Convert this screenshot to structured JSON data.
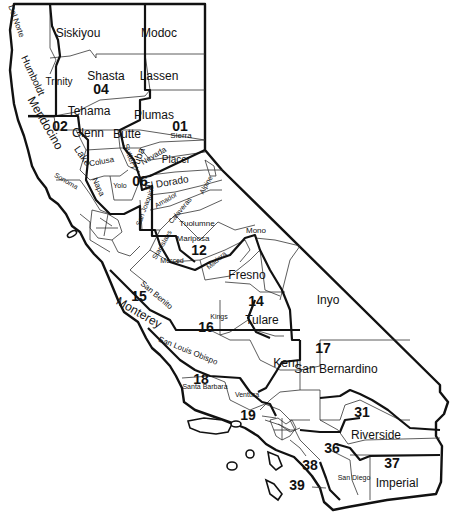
{
  "map": {
    "title": "California Counties and Districts",
    "colors": {
      "ink": "#111111",
      "paper": "#ffffff"
    },
    "counties": [
      {
        "name": "Del Norte",
        "x": 14,
        "y": 22,
        "rot": 70,
        "size": "sm"
      },
      {
        "name": "Siskiyou",
        "x": 78,
        "y": 37,
        "rot": 0,
        "size": "lg"
      },
      {
        "name": "Modoc",
        "x": 159,
        "y": 37,
        "rot": 0,
        "size": "lg"
      },
      {
        "name": "Humboldt",
        "x": 30,
        "y": 77,
        "rot": 65,
        "size": "md"
      },
      {
        "name": "Trinity",
        "x": 59,
        "y": 85,
        "rot": 0,
        "size": "md"
      },
      {
        "name": "Shasta",
        "x": 106,
        "y": 80,
        "rot": 0,
        "size": "lg"
      },
      {
        "name": "Lassen",
        "x": 159,
        "y": 80,
        "rot": 0,
        "size": "lg"
      },
      {
        "name": "Tehama",
        "x": 89,
        "y": 115,
        "rot": 0,
        "size": "lg"
      },
      {
        "name": "Plumas",
        "x": 154,
        "y": 119,
        "rot": 0,
        "size": "lg"
      },
      {
        "name": "Mendocino",
        "x": 42,
        "y": 125,
        "rot": 60,
        "size": "lg"
      },
      {
        "name": "Glenn",
        "x": 88,
        "y": 137,
        "rot": 0,
        "size": "lg"
      },
      {
        "name": "Butte",
        "x": 127,
        "y": 138,
        "rot": 0,
        "size": "lg"
      },
      {
        "name": "Sierra",
        "x": 181,
        "y": 138,
        "rot": 0,
        "size": "sm"
      },
      {
        "name": "Lake",
        "x": 80,
        "y": 158,
        "rot": 55,
        "size": "md"
      },
      {
        "name": "Colusa",
        "x": 102,
        "y": 164,
        "rot": -10,
        "size": "sm"
      },
      {
        "name": "Sutter",
        "x": 127,
        "y": 155,
        "rot": 70,
        "size": "sm"
      },
      {
        "name": "Yuba",
        "x": 141,
        "y": 160,
        "rot": -70,
        "size": "md"
      },
      {
        "name": "Nevada",
        "x": 155,
        "y": 158,
        "rot": -30,
        "size": "sm"
      },
      {
        "name": "Placer",
        "x": 176,
        "y": 163,
        "rot": 0,
        "size": "md"
      },
      {
        "name": "Sonoma",
        "x": 65,
        "y": 183,
        "rot": 30,
        "size": "xs"
      },
      {
        "name": "Napa",
        "x": 96,
        "y": 188,
        "rot": 65,
        "size": "sm"
      },
      {
        "name": "Yolo",
        "x": 120,
        "y": 188,
        "rot": 0,
        "size": "xs"
      },
      {
        "name": "El Dorado",
        "x": 167,
        "y": 186,
        "rot": -10,
        "size": "md"
      },
      {
        "name": "Amador",
        "x": 167,
        "y": 202,
        "rot": -30,
        "size": "xs"
      },
      {
        "name": "Alpine",
        "x": 208,
        "y": 186,
        "rot": -60,
        "size": "xs"
      },
      {
        "name": "San Joaquin",
        "x": 147,
        "y": 208,
        "rot": -70,
        "size": "xs"
      },
      {
        "name": "Calaveras",
        "x": 182,
        "y": 212,
        "rot": -50,
        "size": "xs"
      },
      {
        "name": "Tuolumne",
        "x": 197,
        "y": 226,
        "rot": 0,
        "size": "sm"
      },
      {
        "name": "Mono",
        "x": 256,
        "y": 233,
        "rot": 0,
        "size": "sm"
      },
      {
        "name": "Stanislaus",
        "x": 164,
        "y": 246,
        "rot": -60,
        "size": "xs"
      },
      {
        "name": "Mariposa",
        "x": 193,
        "y": 241,
        "rot": 0,
        "size": "sm"
      },
      {
        "name": "Merced",
        "x": 172,
        "y": 263,
        "rot": 0,
        "size": "xs"
      },
      {
        "name": "Madera",
        "x": 218,
        "y": 262,
        "rot": -40,
        "size": "xs"
      },
      {
        "name": "Fresno",
        "x": 247,
        "y": 279,
        "rot": 0,
        "size": "lg"
      },
      {
        "name": "Inyo",
        "x": 328,
        "y": 304,
        "rot": 0,
        "size": "lg"
      },
      {
        "name": "San Benito",
        "x": 155,
        "y": 297,
        "rot": 40,
        "size": "sm"
      },
      {
        "name": "Kings",
        "x": 219,
        "y": 319,
        "rot": 0,
        "size": "xs"
      },
      {
        "name": "Tulare",
        "x": 262,
        "y": 324,
        "rot": 0,
        "size": "lg"
      },
      {
        "name": "Monterey",
        "x": 137,
        "y": 316,
        "rot": 30,
        "size": "lg"
      },
      {
        "name": "San Louis Obispo",
        "x": 187,
        "y": 353,
        "rot": 22,
        "size": "sm"
      },
      {
        "name": "Kern",
        "x": 286,
        "y": 367,
        "rot": 0,
        "size": "lg"
      },
      {
        "name": "San Bernardino",
        "x": 336,
        "y": 373,
        "rot": 0,
        "size": "lg"
      },
      {
        "name": "Santa Barbara",
        "x": 205,
        "y": 389,
        "rot": 0,
        "size": "xs"
      },
      {
        "name": "Ventura",
        "x": 247,
        "y": 397,
        "rot": 0,
        "size": "xs"
      },
      {
        "name": "Riverside",
        "x": 376,
        "y": 439,
        "rot": 0,
        "size": "lg"
      },
      {
        "name": "San Diego",
        "x": 354,
        "y": 480,
        "rot": 0,
        "size": "xs"
      },
      {
        "name": "Imperial",
        "x": 397,
        "y": 487,
        "rot": 0,
        "size": "lg"
      }
    ],
    "districts": [
      {
        "num": "04",
        "x": 101,
        "y": 94
      },
      {
        "num": "02",
        "x": 60,
        "y": 131
      },
      {
        "num": "01",
        "x": 180,
        "y": 131
      },
      {
        "num": "06",
        "x": 140,
        "y": 186
      },
      {
        "num": "12",
        "x": 199,
        "y": 255
      },
      {
        "num": "14",
        "x": 256,
        "y": 306
      },
      {
        "name": "15",
        "num": "15",
        "x": 139,
        "y": 301
      },
      {
        "num": "16",
        "x": 206,
        "y": 332
      },
      {
        "num": "17",
        "x": 323,
        "y": 353
      },
      {
        "num": "18",
        "x": 201,
        "y": 384
      },
      {
        "num": "19",
        "x": 248,
        "y": 420
      },
      {
        "num": "31",
        "x": 362,
        "y": 417
      },
      {
        "num": "36",
        "x": 332,
        "y": 453
      },
      {
        "num": "37",
        "x": 392,
        "y": 468
      },
      {
        "num": "38",
        "x": 310,
        "y": 470
      },
      {
        "num": "39",
        "x": 297,
        "y": 490
      }
    ]
  }
}
